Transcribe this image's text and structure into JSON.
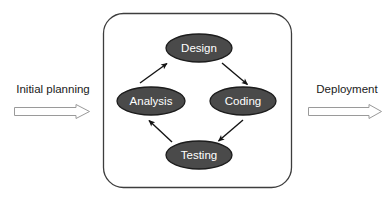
{
  "diagram": {
    "container": {
      "name": "iteration-box",
      "x": 103,
      "y": 13,
      "width": 189,
      "height": 175,
      "radius": 20,
      "stroke": "#3d3d3d",
      "fill": "#ffffff"
    },
    "node_style": {
      "fill": "#4a4a4a",
      "stroke": "#1c1c1c",
      "text_color": "#ffffff",
      "rx": 33,
      "ry": 14
    },
    "nodes": [
      {
        "id": "design",
        "label": "Design",
        "cx": 199,
        "cy": 48,
        "rx": 33,
        "ry": 14
      },
      {
        "id": "coding",
        "label": "Coding",
        "cx": 243,
        "cy": 101,
        "rx": 33,
        "ry": 14
      },
      {
        "id": "testing",
        "label": "Testing",
        "cx": 199,
        "cy": 155,
        "rx": 33,
        "ry": 14
      },
      {
        "id": "analysis",
        "label": "Analysis",
        "cx": 151,
        "cy": 101,
        "rx": 34,
        "ry": 14
      }
    ],
    "edges": [
      {
        "id": "analysis-to-design",
        "from": "Analysis",
        "to": "Design",
        "x1": 140,
        "y1": 83,
        "x2": 167,
        "y2": 63
      },
      {
        "id": "design-to-coding",
        "from": "Design",
        "to": "Coding",
        "x1": 222,
        "y1": 63,
        "x2": 247,
        "y2": 84
      },
      {
        "id": "coding-to-testing",
        "from": "Coding",
        "to": "Testing",
        "x1": 243,
        "y1": 120,
        "x2": 219,
        "y2": 141
      },
      {
        "id": "testing-to-analysis",
        "from": "Testing",
        "to": "Analysis",
        "x1": 172,
        "y1": 142,
        "x2": 149,
        "y2": 120
      }
    ],
    "edge_style": {
      "stroke": "#141414",
      "width": 1.4
    },
    "side_items": [
      {
        "id": "initial-planning",
        "label": "Initial planning",
        "label_x": 53,
        "label_y": 90,
        "arrow": {
          "x": 14,
          "y": 104,
          "width": 76,
          "height": 15,
          "direction": "right"
        }
      },
      {
        "id": "deployment",
        "label": "Deployment",
        "label_x": 347,
        "label_y": 90,
        "arrow": {
          "x": 308,
          "y": 104,
          "width": 74,
          "height": 15,
          "direction": "right"
        }
      }
    ],
    "arrow_style": {
      "fill": "#ffffff",
      "stroke": "#9a9a9a"
    }
  }
}
